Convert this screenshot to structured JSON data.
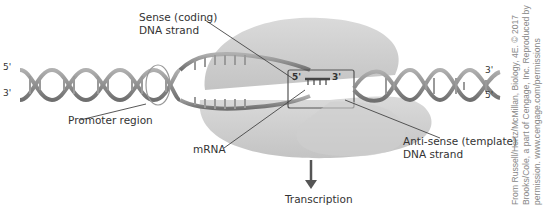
{
  "diagram": {
    "type": "transcription-diagram",
    "labels": {
      "sense_strand_line1": "Sense (coding)",
      "sense_strand_line2": "DNA strand",
      "antisense_strand_line1": "Anti-sense (template)",
      "antisense_strand_line2": "DNA strand",
      "promoter": "Promoter region",
      "mrna": "mRNA",
      "transcription": "Transcription"
    },
    "end_markers": {
      "left_top": "5'",
      "left_bottom": "3'",
      "right_top": "3'",
      "right_bottom": "5'",
      "box_left": "5'",
      "box_right": "3'"
    },
    "credit": {
      "line1": "From Russell/Hertz/McMillan, Biology, 4E. © 2017",
      "line2": "Brooks/Cole, a part of Cengage, Inc. Reproduced by",
      "line3": "permission. www.cengage.com/permissions"
    },
    "colors": {
      "polymerase": "#c9c9c9",
      "dna_strand": "#8a8a8a",
      "text": "#333333",
      "credit": "#888888"
    }
  }
}
